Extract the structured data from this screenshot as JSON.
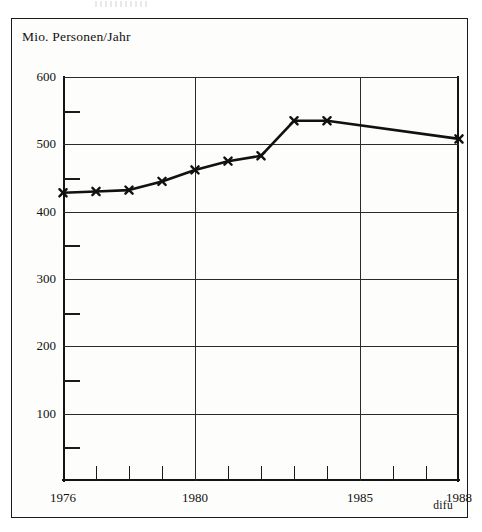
{
  "figure": {
    "axis_title": "Mio. Personen/Jahr",
    "credit": "difu"
  },
  "chart_data": {
    "type": "line",
    "title": "",
    "subtitle": "",
    "xlabel": "",
    "ylabel": "Mio. Personen/Jahr",
    "xlim": [
      1976,
      1988
    ],
    "ylim": [
      0,
      600
    ],
    "grid": true,
    "legend": false,
    "y_major_ticks": [
      0,
      100,
      200,
      300,
      400,
      500,
      600
    ],
    "y_major_tick_labels": [
      "",
      "100",
      "200",
      "300",
      "400",
      "500",
      "600"
    ],
    "y_minor_ticks": [
      50,
      150,
      250,
      350,
      450,
      550
    ],
    "x_ticks": [
      1976,
      1977,
      1978,
      1979,
      1980,
      1981,
      1982,
      1983,
      1984,
      1985,
      1986,
      1987,
      1988
    ],
    "x_tick_labels": [
      "1976",
      "",
      "",
      "",
      "1980",
      "",
      "",
      "",
      "",
      "1985",
      "",
      "",
      "1988"
    ],
    "marker": "x",
    "line_color": "#111111",
    "x": [
      1976,
      1977,
      1978,
      1979,
      1980,
      1981,
      1982,
      1983,
      1984,
      1988
    ],
    "values": [
      428,
      430,
      432,
      445,
      462,
      475,
      483,
      535,
      535,
      508
    ],
    "annotations": [
      "difu"
    ]
  }
}
